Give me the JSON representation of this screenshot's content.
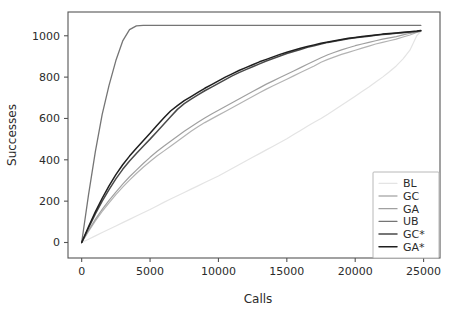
{
  "chart_data": {
    "type": "line",
    "title": "",
    "xlabel": "Calls",
    "ylabel": "Successes",
    "xlim": [
      -1000,
      26200
    ],
    "ylim": [
      -75,
      1115
    ],
    "grid": false,
    "legend_position": "lower right",
    "xticks": [
      0,
      5000,
      10000,
      15000,
      20000,
      25000
    ],
    "xtick_labels": [
      "0",
      "5000",
      "10000",
      "15000",
      "20000",
      "25000"
    ],
    "yticks": [
      0,
      200,
      400,
      600,
      800,
      1000
    ],
    "ytick_labels": [
      "0",
      "200",
      "400",
      "600",
      "800",
      "1000"
    ],
    "x": [
      0,
      500,
      1000,
      1500,
      2000,
      2500,
      3000,
      3500,
      4000,
      4500,
      5000,
      5500,
      6000,
      6500,
      7000,
      7500,
      8000,
      8500,
      9000,
      9500,
      10000,
      10500,
      11000,
      11500,
      12000,
      12500,
      13000,
      13500,
      14000,
      14500,
      15000,
      15500,
      16000,
      16500,
      17000,
      17500,
      18000,
      18500,
      19000,
      19500,
      20000,
      20500,
      21000,
      21500,
      22000,
      22500,
      23000,
      23500,
      24000,
      24500,
      24800
    ],
    "series": [
      {
        "name": "BL",
        "color": "#e4e4e4",
        "width": 1.2,
        "values": [
          0,
          16,
          32,
          48,
          64,
          80,
          96,
          112,
          128,
          144,
          160,
          177,
          194,
          210,
          226,
          242,
          258,
          274,
          290,
          306,
          322,
          340,
          358,
          376,
          394,
          412,
          430,
          448,
          466,
          484,
          502,
          522,
          542,
          562,
          582,
          600,
          620,
          642,
          664,
          686,
          708,
          730,
          752,
          776,
          800,
          826,
          854,
          888,
          930,
          1000,
          1022
        ]
      },
      {
        "name": "GC",
        "color": "#b3b3b3",
        "width": 1.2,
        "values": [
          0,
          54,
          104,
          150,
          192,
          232,
          268,
          302,
          334,
          364,
          392,
          418,
          442,
          466,
          490,
          514,
          538,
          560,
          580,
          598,
          616,
          634,
          652,
          670,
          688,
          706,
          724,
          742,
          758,
          774,
          790,
          806,
          822,
          838,
          854,
          872,
          886,
          898,
          910,
          920,
          930,
          940,
          950,
          960,
          968,
          976,
          984,
          994,
          1004,
          1016,
          1022
        ]
      },
      {
        "name": "GA",
        "color": "#a0a0a0",
        "width": 1.2,
        "values": [
          0,
          58,
          112,
          160,
          204,
          244,
          282,
          318,
          350,
          382,
          412,
          440,
          466,
          490,
          514,
          538,
          560,
          582,
          602,
          622,
          640,
          658,
          676,
          694,
          712,
          730,
          748,
          766,
          782,
          798,
          814,
          830,
          846,
          862,
          878,
          894,
          908,
          920,
          932,
          942,
          952,
          960,
          968,
          976,
          984,
          990,
          996,
          1004,
          1012,
          1018,
          1022
        ]
      },
      {
        "name": "UB",
        "color": "#757575",
        "width": 1.3,
        "values": [
          0,
          230,
          440,
          620,
          760,
          880,
          975,
          1030,
          1048,
          1050,
          1050,
          1050,
          1050,
          1050,
          1050,
          1050,
          1050,
          1050,
          1050,
          1050,
          1050,
          1050,
          1050,
          1050,
          1050,
          1050,
          1050,
          1050,
          1050,
          1050,
          1050,
          1050,
          1050,
          1050,
          1050,
          1050,
          1050,
          1050,
          1050,
          1050,
          1050,
          1050,
          1050,
          1050,
          1050,
          1050,
          1050,
          1050,
          1050,
          1050,
          1050
        ]
      },
      {
        "name": "GC*",
        "color": "#4a4a4a",
        "width": 1.5,
        "values": [
          0,
          70,
          138,
          200,
          256,
          308,
          354,
          394,
          430,
          466,
          500,
          536,
          572,
          608,
          644,
          672,
          694,
          714,
          734,
          752,
          770,
          788,
          806,
          822,
          836,
          850,
          864,
          878,
          890,
          902,
          914,
          924,
          934,
          944,
          952,
          960,
          968,
          974,
          980,
          986,
          990,
          994,
          998,
          1002,
          1006,
          1009,
          1012,
          1015,
          1018,
          1021,
          1024
        ]
      },
      {
        "name": "GA*",
        "color": "#1f1f1f",
        "width": 1.5,
        "values": [
          0,
          76,
          148,
          214,
          274,
          328,
          376,
          418,
          456,
          492,
          528,
          566,
          602,
          636,
          662,
          686,
          706,
          726,
          746,
          764,
          782,
          800,
          816,
          832,
          846,
          860,
          874,
          886,
          898,
          910,
          920,
          930,
          940,
          948,
          956,
          964,
          970,
          976,
          982,
          988,
          992,
          996,
          1000,
          1004,
          1008,
          1011,
          1014,
          1017,
          1020,
          1023,
          1026
        ]
      }
    ]
  },
  "legend": {
    "entries": [
      "BL",
      "GC",
      "GA",
      "UB",
      "GC*",
      "GA*"
    ]
  }
}
